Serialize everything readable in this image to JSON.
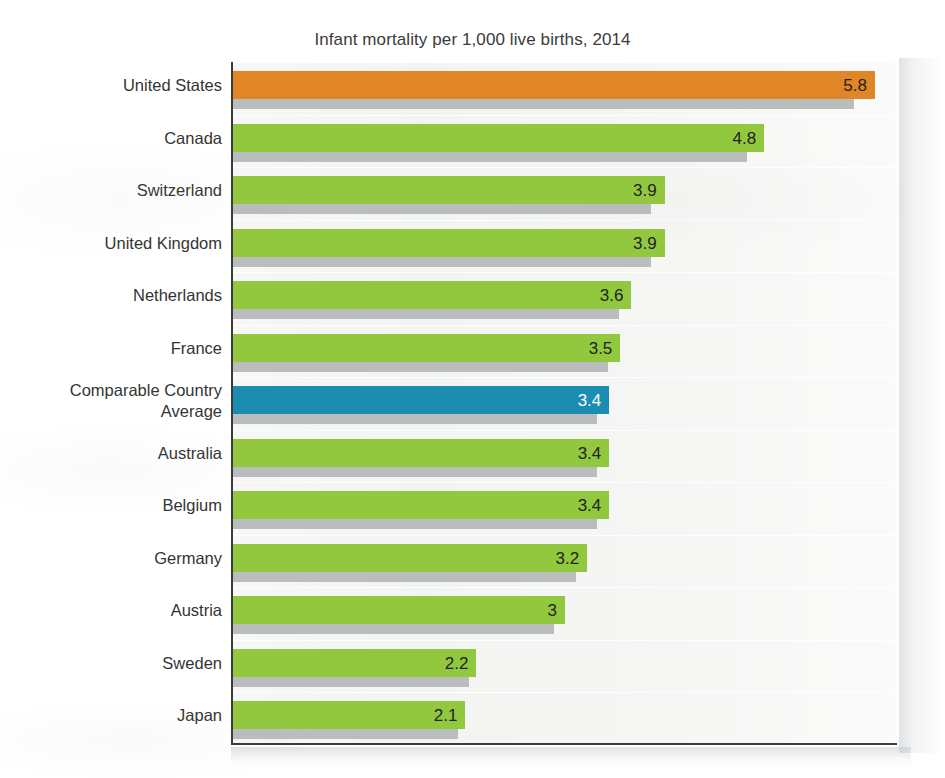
{
  "chart_data": {
    "type": "bar",
    "orientation": "horizontal",
    "title": "Infant mortality per 1,000 live births, 2014",
    "xlabel": "",
    "ylabel": "",
    "xlim": [
      0,
      6.0
    ],
    "grid": true,
    "legend": "none",
    "categories": [
      "United States",
      "Canada",
      "Switzerland",
      "United Kingdom",
      "Netherlands",
      "France",
      "Comparable Country Average",
      "Australia",
      "Belgium",
      "Germany",
      "Austria",
      "Sweden",
      "Japan"
    ],
    "values": [
      5.8,
      4.8,
      3.9,
      3.9,
      3.6,
      3.5,
      3.4,
      3.4,
      3.4,
      3.2,
      3,
      2.2,
      2.1
    ],
    "value_labels": [
      "5.8",
      "4.8",
      "3.9",
      "3.9",
      "3.6",
      "3.5",
      "3.4",
      "3.4",
      "3.4",
      "3.2",
      "3",
      "2.2",
      "2.1"
    ],
    "bar_colors": [
      "#e08626",
      "#92c83e",
      "#92c83e",
      "#92c83e",
      "#92c83e",
      "#92c83e",
      "#1b8db0",
      "#92c83e",
      "#92c83e",
      "#92c83e",
      "#92c83e",
      "#92c83e",
      "#92c83e"
    ],
    "shadow_color": "#b9bdbe"
  },
  "colors": {
    "highlight_orange": "#e08626",
    "country_green": "#92c83e",
    "average_blue": "#1b8db0",
    "shadow_gray": "#b9bdbe",
    "plot_background": "#eef0ec",
    "axis": "#3a3a3a",
    "text": "#343434"
  },
  "rows": [
    {
      "label": "United States",
      "label_line1": "United States",
      "label_line2": "",
      "value": 5.8,
      "value_label": "5.8",
      "color": "#e08626",
      "label_light": false
    },
    {
      "label": "Canada",
      "label_line1": "Canada",
      "label_line2": "",
      "value": 4.8,
      "value_label": "4.8",
      "color": "#92c83e",
      "label_light": false
    },
    {
      "label": "Switzerland",
      "label_line1": "Switzerland",
      "label_line2": "",
      "value": 3.9,
      "value_label": "3.9",
      "color": "#92c83e",
      "label_light": false
    },
    {
      "label": "United Kingdom",
      "label_line1": "United Kingdom",
      "label_line2": "",
      "value": 3.9,
      "value_label": "3.9",
      "color": "#92c83e",
      "label_light": false
    },
    {
      "label": "Netherlands",
      "label_line1": "Netherlands",
      "label_line2": "",
      "value": 3.6,
      "value_label": "3.6",
      "color": "#92c83e",
      "label_light": false
    },
    {
      "label": "France",
      "label_line1": "France",
      "label_line2": "",
      "value": 3.5,
      "value_label": "3.5",
      "color": "#92c83e",
      "label_light": false
    },
    {
      "label": "Comparable Country Average",
      "label_line1": "Comparable Country",
      "label_line2": "Average",
      "value": 3.4,
      "value_label": "3.4",
      "color": "#1b8db0",
      "label_light": true
    },
    {
      "label": "Australia",
      "label_line1": "Australia",
      "label_line2": "",
      "value": 3.4,
      "value_label": "3.4",
      "color": "#92c83e",
      "label_light": false
    },
    {
      "label": "Belgium",
      "label_line1": "Belgium",
      "label_line2": "",
      "value": 3.4,
      "value_label": "3.4",
      "color": "#92c83e",
      "label_light": false
    },
    {
      "label": "Germany",
      "label_line1": "Germany",
      "label_line2": "",
      "value": 3.2,
      "value_label": "3.2",
      "color": "#92c83e",
      "label_light": false
    },
    {
      "label": "Austria",
      "label_line1": "Austria",
      "label_line2": "",
      "value": 3,
      "value_label": "3",
      "color": "#92c83e",
      "label_light": false
    },
    {
      "label": "Sweden",
      "label_line1": "Sweden",
      "label_line2": "",
      "value": 2.2,
      "value_label": "2.2",
      "color": "#92c83e",
      "label_light": false
    },
    {
      "label": "Japan",
      "label_line1": "Japan",
      "label_line2": "",
      "value": 2.1,
      "value_label": "2.1",
      "color": "#92c83e",
      "label_light": false
    }
  ]
}
